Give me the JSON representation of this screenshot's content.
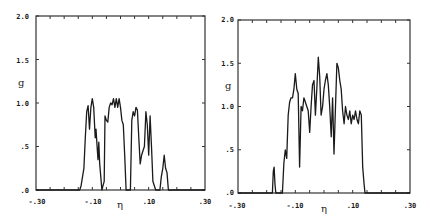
{
  "chart_data": [
    {
      "type": "line",
      "title": "",
      "xlabel": "η",
      "ylabel": "g",
      "xlim": [
        -0.3,
        0.3
      ],
      "ylim": [
        0.0,
        2.0
      ],
      "xticks": [
        "-.30",
        "-.10",
        ".10",
        ".30"
      ],
      "xtick_values": [
        -0.3,
        -0.1,
        0.1,
        0.3
      ],
      "yticks": [
        ".0",
        ".5",
        "1.0",
        "1.5",
        "2.0"
      ],
      "ytick_values": [
        0.0,
        0.5,
        1.0,
        1.5,
        2.0
      ],
      "grid": false,
      "legend": null,
      "frame": {
        "left": 36,
        "right": 205,
        "top": 16,
        "bottom": 190
      },
      "series": [
        {
          "name": "g(η) left",
          "x": [
            -0.3,
            -0.145,
            -0.14,
            -0.135,
            -0.13,
            -0.125,
            -0.12,
            -0.115,
            -0.11,
            -0.105,
            -0.1,
            -0.095,
            -0.09,
            -0.087,
            -0.083,
            -0.08,
            -0.077,
            -0.074,
            -0.07,
            -0.066,
            -0.062,
            -0.058,
            -0.055,
            -0.05,
            -0.045,
            -0.04,
            -0.035,
            -0.03,
            -0.025,
            -0.02,
            -0.015,
            -0.01,
            -0.005,
            0.0,
            0.005,
            0.01,
            0.015,
            0.02,
            0.025,
            0.03,
            0.035,
            0.04,
            0.045,
            0.05,
            0.055,
            0.06,
            0.065,
            0.07,
            0.075,
            0.08,
            0.085,
            0.09,
            0.095,
            0.1,
            0.105,
            0.11,
            0.115,
            0.12,
            0.125,
            0.14,
            0.145,
            0.15,
            0.155,
            0.16,
            0.165,
            0.17,
            0.3
          ],
          "y": [
            0.0,
            0.0,
            0.05,
            0.15,
            0.25,
            0.6,
            0.9,
            0.97,
            0.7,
            0.95,
            1.05,
            0.95,
            0.6,
            0.7,
            0.5,
            0.35,
            0.55,
            0.3,
            0.15,
            0.0,
            0.05,
            0.1,
            0.85,
            0.8,
            0.78,
            0.95,
            1.0,
            0.98,
            1.05,
            0.95,
            1.05,
            0.95,
            1.05,
            0.95,
            0.8,
            0.75,
            0.4,
            0.0,
            0.0,
            0.0,
            0.0,
            0.8,
            0.9,
            0.85,
            0.95,
            0.92,
            0.6,
            0.3,
            0.4,
            0.45,
            0.5,
            0.9,
            0.75,
            0.4,
            0.85,
            0.5,
            0.1,
            0.05,
            0.0,
            0.0,
            0.15,
            0.25,
            0.4,
            0.25,
            0.2,
            0.0,
            0.0
          ]
        }
      ]
    },
    {
      "type": "line",
      "title": "",
      "xlabel": "η",
      "ylabel": "g",
      "xlim": [
        -0.3,
        0.3
      ],
      "ylim": [
        0.0,
        2.0
      ],
      "xticks": [
        "-.30",
        "-.10",
        ".10",
        ".30"
      ],
      "xtick_values": [
        -0.3,
        -0.1,
        0.1,
        0.3
      ],
      "yticks": [
        ".0",
        ".5",
        "1.0",
        "1.5",
        "2.0"
      ],
      "ytick_values": [
        0.0,
        0.5,
        1.0,
        1.5,
        2.0
      ],
      "grid": false,
      "legend": null,
      "frame": {
        "left": 238,
        "right": 410,
        "top": 20,
        "bottom": 193
      },
      "series": [
        {
          "name": "g(η) right",
          "x": [
            -0.3,
            -0.18,
            -0.177,
            -0.174,
            -0.171,
            -0.168,
            -0.15,
            -0.145,
            -0.14,
            -0.135,
            -0.13,
            -0.125,
            -0.12,
            -0.115,
            -0.11,
            -0.105,
            -0.1,
            -0.095,
            -0.09,
            -0.085,
            -0.08,
            -0.075,
            -0.07,
            -0.065,
            -0.06,
            -0.055,
            -0.05,
            -0.045,
            -0.04,
            -0.035,
            -0.03,
            -0.025,
            -0.02,
            -0.015,
            -0.01,
            -0.005,
            0.0,
            0.005,
            0.01,
            0.015,
            0.02,
            0.025,
            0.03,
            0.035,
            0.04,
            0.045,
            0.05,
            0.055,
            0.06,
            0.065,
            0.07,
            0.075,
            0.08,
            0.085,
            0.09,
            0.095,
            0.1,
            0.105,
            0.11,
            0.115,
            0.12,
            0.125,
            0.13,
            0.135,
            0.14,
            0.143,
            0.146,
            0.3
          ],
          "y": [
            0.0,
            0.0,
            0.25,
            0.3,
            0.1,
            0.0,
            0.0,
            0.0,
            0.35,
            0.5,
            0.4,
            0.9,
            1.05,
            1.1,
            1.1,
            1.2,
            1.38,
            1.2,
            1.15,
            0.3,
            1.0,
            0.95,
            1.1,
            1.05,
            1.0,
            0.95,
            0.7,
            1.0,
            1.25,
            1.3,
            0.9,
            1.2,
            1.57,
            1.35,
            0.9,
            1.0,
            1.2,
            1.3,
            1.38,
            1.25,
            1.0,
            0.65,
            1.1,
            0.45,
            1.0,
            1.5,
            1.45,
            1.3,
            1.2,
            0.95,
            0.8,
            1.0,
            0.9,
            0.85,
            0.95,
            0.8,
            0.9,
            0.85,
            0.95,
            0.85,
            0.8,
            0.95,
            0.9,
            0.3,
            0.1,
            0.0,
            0.0,
            0.0
          ]
        }
      ]
    }
  ],
  "plots": [
    {
      "ylabel": "g",
      "xlabel": "η",
      "xticks": [
        "-.30",
        "-.10",
        ".10",
        ".30"
      ],
      "yticks": [
        ".0",
        ".5",
        "1.0",
        "1.5",
        "2.0"
      ]
    },
    {
      "ylabel": "g",
      "xlabel": "η",
      "xticks": [
        "-.30",
        "-.10",
        ".10",
        ".30"
      ],
      "yticks": [
        ".0",
        ".5",
        "1.0",
        "1.5",
        "2.0"
      ]
    }
  ],
  "colors": {
    "line": "#1a1a1a",
    "frame": "#333333",
    "background": "#ffffff"
  }
}
